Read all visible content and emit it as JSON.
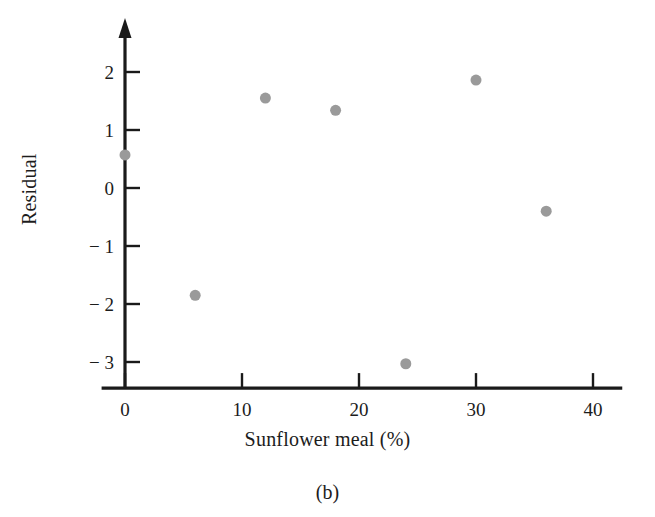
{
  "figure": {
    "caption": "(b)",
    "point_color": "#9a9a9a",
    "axis_color": "#1a1a1a",
    "background": "#ffffff"
  },
  "chart_data": {
    "type": "scatter",
    "title": "",
    "subtitle": "",
    "xlabel": "Sunflower meal (%)",
    "ylabel": "Residual",
    "xlim": [
      -2,
      42.5
    ],
    "ylim": [
      -3.45,
      2.45
    ],
    "xticks": [
      0,
      10,
      20,
      30,
      40
    ],
    "xtick_labels": [
      "0",
      "10",
      "20",
      "30",
      "40"
    ],
    "yticks": [
      2,
      1,
      0,
      -1,
      -2,
      -3
    ],
    "ytick_labels": [
      "2",
      "1",
      "0",
      "− 1",
      "− 2",
      "− 3"
    ],
    "grid": false,
    "legend": null,
    "tick_direction": "in",
    "x": [
      0,
      6,
      12,
      18,
      24,
      30,
      36
    ],
    "y": [
      0.57,
      -1.85,
      1.55,
      1.34,
      -3.03,
      1.86,
      -0.4
    ],
    "points": [
      {
        "x": 0,
        "y": 0.57
      },
      {
        "x": 6,
        "y": -1.85
      },
      {
        "x": 12,
        "y": 1.55
      },
      {
        "x": 18,
        "y": 1.34
      },
      {
        "x": 24,
        "y": -3.03
      },
      {
        "x": 30,
        "y": 1.86
      },
      {
        "x": 36,
        "y": -0.4
      }
    ],
    "marker": "circle",
    "marker_size": 11,
    "annotations": []
  }
}
